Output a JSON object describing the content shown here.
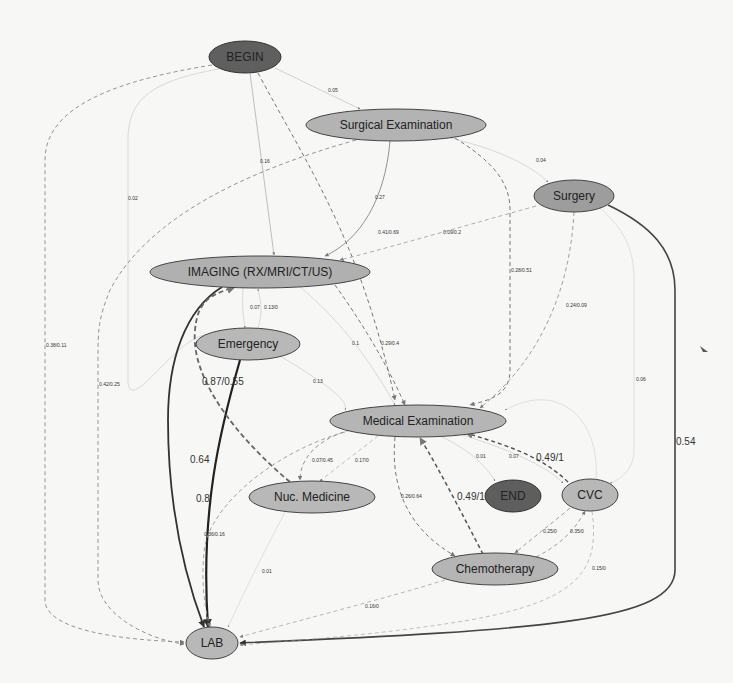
{
  "diagram": {
    "type": "process-flow-graph",
    "background": "#f7f7f5",
    "nodes": [
      {
        "id": "begin",
        "label": "BEGIN",
        "cx": 245,
        "cy": 57,
        "rx": 36,
        "ry": 16,
        "fill": "#5f5f5f"
      },
      {
        "id": "surgical_exam",
        "label": "Surgical Examination",
        "cx": 396,
        "cy": 125,
        "rx": 90,
        "ry": 16,
        "fill": "#b3b3b3"
      },
      {
        "id": "surgery",
        "label": "Surgery",
        "cx": 574,
        "cy": 196,
        "rx": 40,
        "ry": 16,
        "fill": "#9d9d9d"
      },
      {
        "id": "imaging",
        "label": "IMAGING (RX/MRI/CT/US)",
        "cx": 260,
        "cy": 272,
        "rx": 110,
        "ry": 16,
        "fill": "#b0b0b0"
      },
      {
        "id": "emergency",
        "label": "Emergency",
        "cx": 248,
        "cy": 344,
        "rx": 52,
        "ry": 16,
        "fill": "#b8b8b8"
      },
      {
        "id": "medical_exam",
        "label": "Medical Examination",
        "cx": 418,
        "cy": 421,
        "rx": 88,
        "ry": 16,
        "fill": "#b5b5b5"
      },
      {
        "id": "nuc_medicine",
        "label": "Nuc. Medicine",
        "cx": 312,
        "cy": 497,
        "rx": 63,
        "ry": 16,
        "fill": "#b8b8b8"
      },
      {
        "id": "end",
        "label": "END",
        "cx": 513,
        "cy": 496,
        "rx": 28,
        "ry": 16,
        "fill": "#5e5e5e"
      },
      {
        "id": "cvc",
        "label": "CVC",
        "cx": 590,
        "cy": 495,
        "rx": 28,
        "ry": 16,
        "fill": "#b8b8b8"
      },
      {
        "id": "chemotherapy",
        "label": "Chemotherapy",
        "cx": 495,
        "cy": 569,
        "rx": 63,
        "ry": 16,
        "fill": "#b5b5b5"
      },
      {
        "id": "lab",
        "label": "LAB",
        "cx": 212,
        "cy": 643,
        "rx": 26,
        "ry": 16,
        "fill": "#b8b8b8"
      }
    ],
    "edges": [
      {
        "from": "begin",
        "to": "surgical_exam",
        "label": "0.05",
        "style": "solid",
        "width": 0.5
      },
      {
        "from": "begin",
        "to": "imaging",
        "label": "0.16",
        "style": "solid",
        "width": 0.6
      },
      {
        "from": "begin",
        "to": "medical_exam",
        "label": "0.41/0.69",
        "style": "dashed",
        "width": 1.0
      },
      {
        "from": "begin",
        "to": "emergency",
        "label": "0.02",
        "style": "solid",
        "width": 0.4
      },
      {
        "from": "begin",
        "to": "lab",
        "label": "0.38/0.11",
        "style": "dashed",
        "width": 0.9
      },
      {
        "from": "surgical_exam",
        "to": "imaging",
        "label": "0.27",
        "style": "solid",
        "width": 0.8
      },
      {
        "from": "surgical_exam",
        "to": "surgery",
        "label": "0.04",
        "style": "solid",
        "width": 0.4
      },
      {
        "from": "surgical_exam",
        "to": "medical_exam",
        "label": "0.28/0.51",
        "style": "dashed",
        "width": 1.0
      },
      {
        "from": "surgical_exam",
        "to": "lab",
        "label": "0.42/0.25",
        "style": "dashed",
        "width": 0.9
      },
      {
        "from": "surgery",
        "to": "imaging",
        "label": "0.09/0.2",
        "style": "dashed",
        "width": 0.8
      },
      {
        "from": "surgery",
        "to": "medical_exam",
        "label": "0.24/0.09",
        "style": "dashed",
        "width": 0.8
      },
      {
        "from": "surgery",
        "to": "cvc",
        "label": "0.06",
        "style": "solid",
        "width": 0.4
      },
      {
        "from": "surgery",
        "to": "lab",
        "label": "0.54",
        "style": "solid",
        "width": 1.6
      },
      {
        "from": "imaging",
        "to": "emergency",
        "label": "0.07",
        "style": "solid",
        "width": 0.4
      },
      {
        "from": "emergency",
        "to": "imaging",
        "label": "0.13/0",
        "style": "solid",
        "width": 0.4
      },
      {
        "from": "imaging",
        "to": "medical_exam",
        "label": "0.1",
        "style": "solid",
        "width": 0.4
      },
      {
        "from": "imaging",
        "to": "medical_exam",
        "label": "0.29/0.4",
        "style": "dashed",
        "width": 1.0
      },
      {
        "from": "emergency",
        "to": "medical_exam",
        "label": "0.13",
        "style": "solid",
        "width": 0.4
      },
      {
        "from": "imaging",
        "to": "lab",
        "label": "0.64",
        "style": "solid",
        "width": 1.8
      },
      {
        "from": "emergency",
        "to": "lab",
        "label": "0.8",
        "style": "solid",
        "width": 2.2
      },
      {
        "from": "nuc_medicine",
        "to": "imaging",
        "label": "0.87/0.55",
        "style": "dashed",
        "width": 1.8
      },
      {
        "from": "medical_exam",
        "to": "nuc_medicine",
        "label": "0.07/0.45",
        "style": "dashed",
        "width": 0.9
      },
      {
        "from": "medical_exam",
        "to": "nuc_medicine",
        "label": "0.17/0",
        "style": "dashed",
        "width": 0.6
      },
      {
        "from": "medical_exam",
        "to": "end",
        "label": "0.01",
        "style": "solid",
        "width": 0.4
      },
      {
        "from": "medical_exam",
        "to": "cvc",
        "label": "0.07",
        "style": "solid",
        "width": 0.4
      },
      {
        "from": "cvc",
        "to": "medical_exam",
        "label": "0.49/1",
        "style": "dashed",
        "width": 1.5
      },
      {
        "from": "medical_exam",
        "to": "chemotherapy",
        "label": "0.26/0.64",
        "style": "dashed",
        "width": 1.0
      },
      {
        "from": "chemotherapy",
        "to": "medical_exam",
        "label": "0.49/1",
        "style": "dashed",
        "width": 1.5
      },
      {
        "from": "cvc",
        "to": "medical_exam",
        "label": "0.05",
        "style": "solid",
        "width": 0.4
      },
      {
        "from": "cvc",
        "to": "chemotherapy",
        "label": "0.25/0",
        "style": "dashed",
        "width": 0.8
      },
      {
        "from": "chemotherapy",
        "to": "cvc",
        "label": "0.35/0",
        "style": "dashed",
        "width": 0.8
      },
      {
        "from": "cvc",
        "to": "lab",
        "label": "0.15/0",
        "style": "dashed",
        "width": 0.6
      },
      {
        "from": "nuc_medicine",
        "to": "lab",
        "label": "0.01",
        "style": "solid",
        "width": 0.4
      },
      {
        "from": "medical_exam",
        "to": "lab",
        "label": "0.36/0.16",
        "style": "dashed",
        "width": 0.9
      },
      {
        "from": "chemotherapy",
        "to": "lab",
        "label": "0.16/0",
        "style": "dashed",
        "width": 0.7
      }
    ]
  },
  "labels": {
    "begin": "BEGIN",
    "surgical_exam": "Surgical Examination",
    "surgery": "Surgery",
    "imaging": "IMAGING (RX/MRI/CT/US)",
    "emergency": "Emergency",
    "medical_exam": "Medical Examination",
    "nuc_medicine": "Nuc. Medicine",
    "end": "END",
    "cvc": "CVC",
    "chemotherapy": "Chemotherapy",
    "lab": "LAB",
    "e_begin_surgexam": "0.05",
    "e_begin_imaging": "0.16",
    "e_begin_medexam": "0.41/0.69",
    "e_begin_emergency": "0.02",
    "e_begin_lab": "0.38/0.11",
    "e_surgexam_imaging": "0.27",
    "e_surgexam_surgery": "0.04",
    "e_surgexam_medexam": "0.28/0.51",
    "e_surgexam_lab": "0.42/0.25",
    "e_surgery_imaging": "0.09/0.2",
    "e_surgery_medexam": "0.24/0.09",
    "e_surgery_cvc": "0.06",
    "e_surgery_lab": "0.54",
    "e_imaging_emergency": "0.07",
    "e_emergency_imaging": "0.13/0",
    "e_imaging_medexam_a": "0.1",
    "e_imaging_medexam_b": "0.29/0.4",
    "e_emergency_medexam": "0.13",
    "e_imaging_lab": "0.64",
    "e_emergency_lab": "0.8",
    "e_nuc_imaging": "0.87/0.55",
    "e_medexam_nuc_a": "0.07/0.45",
    "e_medexam_nuc_b": "0.17/0",
    "e_medexam_end": "0.01",
    "e_medexam_cvc": "0.07",
    "e_cvc_medexam": "0.49/1",
    "e_medexam_chemo": "0.26/0.64",
    "e_chemo_medexam": "0.49/1",
    "e_cvc_chemo": "0.25/0",
    "e_chemo_cvc": "0.35/0",
    "e_cvc_lab": "0.15/0",
    "e_nuc_lab": "0.01",
    "e_medexam_lab": "0.36/0.16",
    "e_chemo_lab": "0.16/0"
  }
}
